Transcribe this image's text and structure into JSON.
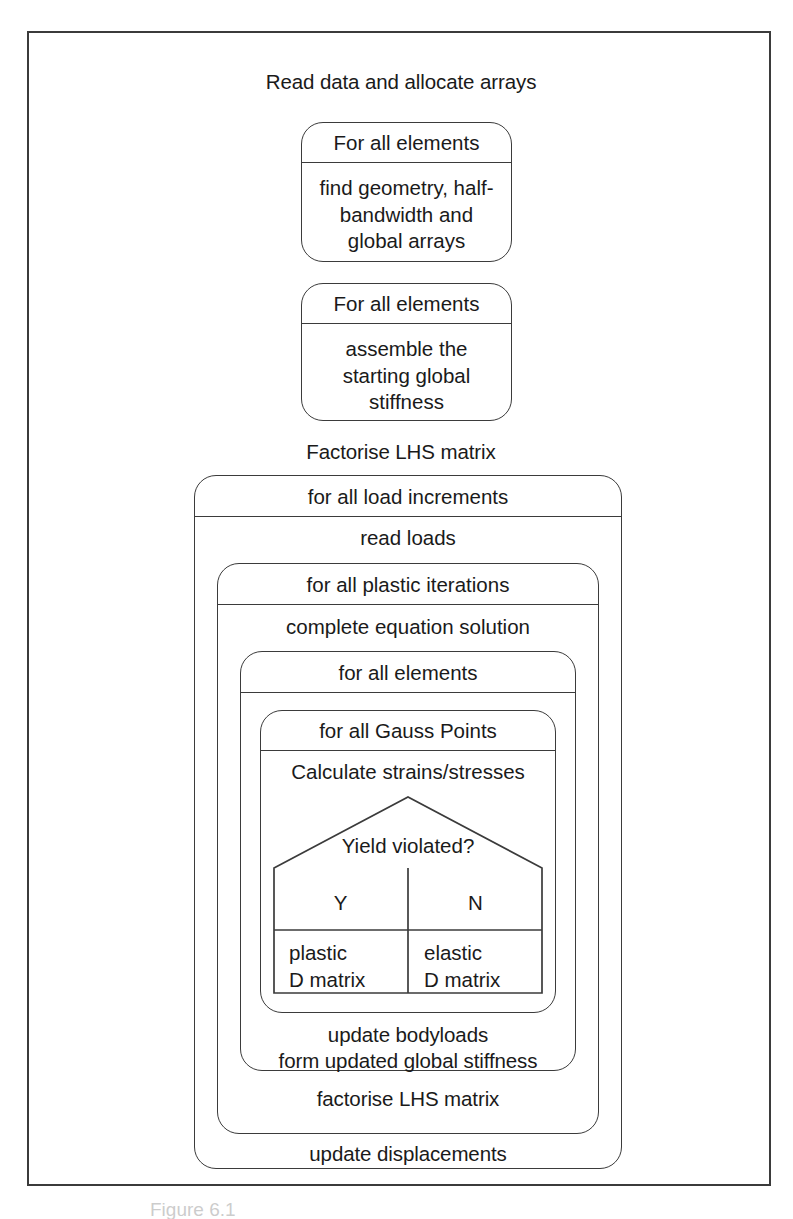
{
  "figure": {
    "kind": "structured-flowchart",
    "caption": "Figure 6.1"
  },
  "steps": {
    "read_data": "Read data and allocate arrays",
    "factorise_lhs_top": "Factorise LHS matrix"
  },
  "boxes": {
    "geometry_loop": {
      "header": "For all elements",
      "body": "find geometry, half-\nbandwidth and\nglobal arrays"
    },
    "assemble_loop": {
      "header": "For all elements",
      "body": "assemble the\nstarting global\nstiffness"
    },
    "load_increments": {
      "header": "for all load increments",
      "body": "read loads"
    },
    "plastic_iterations": {
      "header": "for all plastic iterations",
      "body": "complete equation solution"
    },
    "elements_loop": {
      "header": "for all elements"
    },
    "gauss_loop": {
      "header": "for all Gauss Points",
      "body": "Calculate strains/stresses"
    },
    "after_gauss": "update bodyloads\nform updated global stiffness",
    "after_elements": "factorise LHS matrix",
    "after_plastic": "update displacements"
  },
  "decision": {
    "question": "Yield violated?",
    "yes_label": "Y",
    "no_label": "N",
    "yes_body": "plastic\nD matrix",
    "no_body": "elastic\nD matrix"
  },
  "colors": {
    "line": "#3b3b3b",
    "text": "#1a1a1a",
    "background": "#ffffff"
  }
}
